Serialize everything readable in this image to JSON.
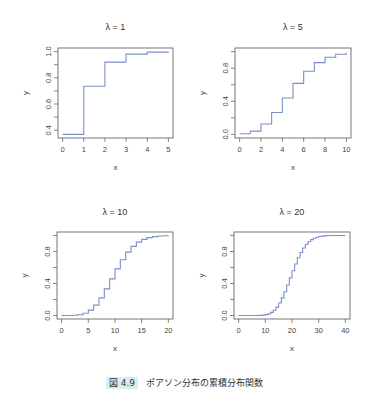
{
  "caption": {
    "label": "図 4.9",
    "text": "ポアソン分布の累積分布関数",
    "badge_color": "#d6f0f2"
  },
  "line_color": "#7b8fc9",
  "chart_data": [
    {
      "type": "line",
      "step": true,
      "title": "λ = 1",
      "xlabel": "x",
      "ylabel": "y",
      "xlim": [
        0,
        5
      ],
      "ylim": [
        0.3679,
        1.0
      ],
      "xticks": [
        0,
        1,
        2,
        3,
        4,
        5
      ],
      "yticks": [
        0.4,
        0.6,
        0.8,
        1.0
      ],
      "ytick_labels": [
        "0.4",
        "0.6",
        "0.8",
        "1.0"
      ],
      "x": [
        0,
        1,
        2,
        3,
        4,
        5
      ],
      "y": [
        0.368,
        0.736,
        0.92,
        0.981,
        0.996,
        0.999
      ]
    },
    {
      "type": "line",
      "step": true,
      "title": "λ = 5",
      "xlabel": "x",
      "ylabel": "y",
      "xlim": [
        0,
        10
      ],
      "ylim": [
        0.0,
        1.0
      ],
      "xticks": [
        0,
        2,
        4,
        6,
        8,
        10
      ],
      "yticks": [
        0.0,
        0.4,
        0.8
      ],
      "ytick_labels": [
        "0.0",
        "0.4",
        "0.8"
      ],
      "minor_yticks": [
        0.2,
        0.6,
        1.0
      ],
      "x": [
        0,
        1,
        2,
        3,
        4,
        5,
        6,
        7,
        8,
        9,
        10
      ],
      "y": [
        0.007,
        0.04,
        0.125,
        0.265,
        0.44,
        0.616,
        0.762,
        0.867,
        0.932,
        0.968,
        0.986
      ]
    },
    {
      "type": "line",
      "step": true,
      "title": "λ = 10",
      "xlabel": "x",
      "ylabel": "y",
      "xlim": [
        0,
        20
      ],
      "ylim": [
        0.0,
        1.0
      ],
      "xticks": [
        0,
        5,
        10,
        15,
        20
      ],
      "yticks": [
        0.0,
        0.4,
        0.8
      ],
      "ytick_labels": [
        "0.0",
        "0.4",
        "0.8"
      ],
      "minor_yticks": [
        0.2,
        0.6,
        1.0
      ],
      "x": [
        0,
        1,
        2,
        3,
        4,
        5,
        6,
        7,
        8,
        9,
        10,
        11,
        12,
        13,
        14,
        15,
        16,
        17,
        18,
        19,
        20
      ],
      "y": [
        0.0,
        0.0,
        0.003,
        0.01,
        0.029,
        0.067,
        0.13,
        0.22,
        0.333,
        0.458,
        0.583,
        0.697,
        0.792,
        0.864,
        0.917,
        0.951,
        0.973,
        0.986,
        0.993,
        0.997,
        0.998
      ]
    },
    {
      "type": "line",
      "step": true,
      "title": "λ = 20",
      "xlabel": "x",
      "ylabel": "y",
      "xlim": [
        0,
        40
      ],
      "ylim": [
        0.0,
        1.0
      ],
      "xticks": [
        0,
        10,
        20,
        30,
        40
      ],
      "yticks": [
        0.0,
        0.4,
        0.8
      ],
      "ytick_labels": [
        "0.0",
        "0.4",
        "0.8"
      ],
      "minor_yticks": [
        0.2,
        0.6,
        1.0
      ],
      "x": [
        0,
        1,
        2,
        3,
        4,
        5,
        6,
        7,
        8,
        9,
        10,
        11,
        12,
        13,
        14,
        15,
        16,
        17,
        18,
        19,
        20,
        21,
        22,
        23,
        24,
        25,
        26,
        27,
        28,
        29,
        30,
        31,
        32,
        33,
        34,
        35,
        36,
        37,
        38,
        39,
        40
      ],
      "y": [
        0.0,
        0.0,
        0.0,
        0.0,
        0.0,
        0.0,
        0.0,
        0.001,
        0.002,
        0.005,
        0.011,
        0.021,
        0.039,
        0.066,
        0.105,
        0.157,
        0.221,
        0.297,
        0.381,
        0.47,
        0.559,
        0.644,
        0.721,
        0.787,
        0.843,
        0.888,
        0.922,
        0.948,
        0.966,
        0.978,
        0.987,
        0.992,
        0.995,
        0.997,
        0.999,
        0.999,
        1.0,
        1.0,
        1.0,
        1.0,
        1.0
      ]
    }
  ]
}
